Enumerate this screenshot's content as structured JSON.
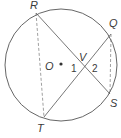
{
  "diagram": {
    "type": "circle-chords",
    "circle": {
      "center": "O",
      "cx": 61,
      "cy": 65,
      "r": 56
    },
    "points": {
      "R": {
        "label": "R",
        "x": 36,
        "y": 13,
        "lx": 30,
        "ly": 9
      },
      "Q": {
        "label": "Q",
        "x": 111,
        "y": 34,
        "lx": 109,
        "ly": 27
      },
      "S": {
        "label": "S",
        "x": 110,
        "y": 94,
        "lx": 110,
        "ly": 107
      },
      "T": {
        "label": "T",
        "x": 44,
        "y": 117,
        "lx": 37,
        "ly": 132
      },
      "V": {
        "label": "V",
        "x": 85,
        "y": 68,
        "lx": 79,
        "ly": 61
      },
      "O": {
        "label": "O",
        "x": 61,
        "y": 64,
        "lx": 45,
        "ly": 70
      }
    },
    "angles": [
      {
        "label": "1",
        "x": 71,
        "y": 72
      },
      {
        "label": "2",
        "x": 92,
        "y": 72
      }
    ],
    "solid_segments": [
      "RS",
      "QT"
    ],
    "dashed_segments": [
      "RT",
      "QS"
    ],
    "colors": {
      "stroke": "#555555",
      "text": "#3a3a3a",
      "background": "#ffffff"
    }
  }
}
